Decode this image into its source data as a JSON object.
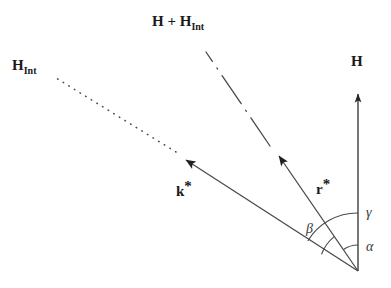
{
  "figure": {
    "type": "vector-diagram",
    "background_color": "#ffffff",
    "stroke_color": "#3a3a3a",
    "text_color": "#1a1a1a"
  },
  "labels": {
    "h_int": {
      "base": "H",
      "sub": "Int"
    },
    "h_sum": {
      "base": "H + H",
      "sub": "Int"
    },
    "h": {
      "base": "H"
    },
    "k_star": {
      "base": "k",
      "star": "*"
    },
    "r_star": {
      "base": "r",
      "star": "*"
    },
    "alpha": "α",
    "beta": "β",
    "gamma": "γ"
  },
  "geometry": {
    "origin": {
      "x": 358,
      "y": 271
    },
    "vectors": [
      {
        "name": "H",
        "label": "H",
        "style": "solid",
        "tip": {
          "x": 358,
          "y": 88
        },
        "angle_from_vertical_deg": 0
      },
      {
        "name": "r-star",
        "label": "r*",
        "style": "solid",
        "tip": {
          "x": 274,
          "y": 150
        },
        "angle_from_vertical_deg": 34
      },
      {
        "name": "k-star",
        "label": "k*",
        "style": "solid",
        "tip": {
          "x": 180,
          "y": 155
        },
        "angle_from_vertical_deg": 60
      }
    ],
    "extensions": [
      {
        "name": "h-int-dotted-extension",
        "style": "dotted",
        "from": {
          "x": 180,
          "y": 155
        },
        "to": {
          "x": 55,
          "y": 78
        },
        "continues": "k-star"
      },
      {
        "name": "h-sum-dashdot-extension",
        "style": "dash-dot",
        "from": {
          "x": 274,
          "y": 150
        },
        "to": {
          "x": 205,
          "y": 48
        },
        "continues": "r-star"
      }
    ],
    "angle_arcs": [
      {
        "name": "alpha",
        "label": "α",
        "radius": 26,
        "between": [
          "H",
          "r-star"
        ],
        "start_deg": 0,
        "end_deg": 34
      },
      {
        "name": "beta",
        "label": "β",
        "radius": 58,
        "between": [
          "H",
          "k-star"
        ],
        "start_deg": 0,
        "end_deg": 60
      },
      {
        "name": "gamma",
        "label": "γ",
        "radius": 42,
        "between": [
          "r-star",
          "k-star"
        ],
        "start_deg": 34,
        "end_deg": 60
      }
    ]
  }
}
